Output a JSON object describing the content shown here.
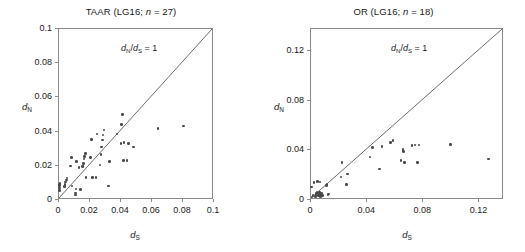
{
  "figure": {
    "background": "#ffffff",
    "point_color": "#4a4a4a",
    "axis_color": "#8a8a8a",
    "text_color": "#1a1a1a",
    "axis_label_x": "dS",
    "axis_label_y": "dN",
    "annotation": "dN/dS = 1"
  },
  "chart_data": [
    {
      "type": "scatter",
      "title": "TAAR (LG16; n = 27)",
      "title_prefix": "TAAR (LG16; ",
      "title_italic": "n",
      "title_suffix": " = 27)",
      "gene_family": "TAAR",
      "linkage_group": "LG16",
      "n": 27,
      "xlabel": "dS",
      "ylabel": "dN",
      "xlim": [
        0,
        0.1
      ],
      "ylim": [
        0,
        0.1
      ],
      "xticks": [
        0,
        0.02,
        0.04,
        0.06,
        0.08,
        0.1
      ],
      "xticklabels": [
        "0",
        "0.02",
        "0.04",
        "0.06",
        "0.08",
        "0.1"
      ],
      "yticks": [
        0,
        0.02,
        0.04,
        0.06,
        0.08,
        0.1
      ],
      "yticklabels": [
        "0",
        "0.02",
        "0.04",
        "0.06",
        "0.08",
        "0.1"
      ],
      "grid": false,
      "legend": "none",
      "annotations": [
        {
          "text": "dN/dS = 1",
          "x": 0.062,
          "y": 0.091
        }
      ],
      "reference_line": {
        "type": "diagonal",
        "slope": 1,
        "intercept": 0,
        "label": "dN/dS = 1"
      },
      "x": [
        0.0002,
        0.0003,
        0.0004,
        0.0005,
        0.0006,
        0.0035,
        0.004,
        0.0042,
        0.005,
        0.0052,
        0.0075,
        0.008,
        0.0085,
        0.0105,
        0.0108,
        0.011,
        0.0112,
        0.013,
        0.014,
        0.0152,
        0.0155,
        0.0158,
        0.016,
        0.0165,
        0.017,
        0.0175,
        0.0205,
        0.021,
        0.0215,
        0.024,
        0.0245,
        0.0265,
        0.027,
        0.0275,
        0.028,
        0.0285,
        0.029,
        0.032,
        0.0325,
        0.0375,
        0.04,
        0.0405,
        0.041,
        0.0415,
        0.042,
        0.044,
        0.045,
        0.048,
        0.064,
        0.0805
      ],
      "y": [
        0.0055,
        0.007,
        0.0085,
        0.0092,
        0.0098,
        0.0078,
        0.009,
        0.0105,
        0.0118,
        0.0128,
        0.02,
        0.0248,
        0.0082,
        0.003,
        0.004,
        0.0065,
        0.0225,
        0.019,
        0.0062,
        0.0195,
        0.02,
        0.0215,
        0.024,
        0.0255,
        0.0272,
        0.0132,
        0.025,
        0.0355,
        0.013,
        0.0132,
        0.0385,
        0.0205,
        0.0265,
        0.031,
        0.035,
        0.038,
        0.041,
        0.0082,
        0.0225,
        0.0385,
        0.033,
        0.044,
        0.05,
        0.0232,
        0.0335,
        0.0232,
        0.033,
        0.031,
        0.0418,
        0.0432
      ]
    },
    {
      "type": "scatter",
      "title": "OR (LG16; n = 18)",
      "title_prefix": "OR (LG16; ",
      "title_italic": "n",
      "title_suffix": " = 18)",
      "gene_family": "OR",
      "linkage_group": "LG16",
      "n": 18,
      "xlabel": "dS",
      "ylabel": "dN",
      "xlim": [
        0,
        0.1375
      ],
      "ylim": [
        0,
        0.1375
      ],
      "xticks": [
        0,
        0.04,
        0.08,
        0.12
      ],
      "xticklabels": [
        "0",
        "0.04",
        "0.08",
        "0.12"
      ],
      "yticks": [
        0,
        0.04,
        0.08,
        0.12
      ],
      "yticklabels": [
        "0",
        "0.04",
        "0.08",
        "0.12"
      ],
      "grid": false,
      "legend": "none",
      "annotations": [
        {
          "text": "dN/dS = 1",
          "x": 0.085,
          "y": 0.125
        }
      ],
      "reference_line": {
        "type": "diagonal",
        "slope": 1,
        "intercept": 0,
        "label": "dN/dS = 1"
      },
      "x": [
        0.0005,
        0.0008,
        0.0015,
        0.002,
        0.003,
        0.0035,
        0.0038,
        0.0042,
        0.0048,
        0.0055,
        0.006,
        0.0062,
        0.0065,
        0.0068,
        0.0075,
        0.008,
        0.011,
        0.0115,
        0.012,
        0.0125,
        0.0215,
        0.022,
        0.0255,
        0.0262,
        0.042,
        0.044,
        0.049,
        0.0505,
        0.0565,
        0.0585,
        0.064,
        0.0655,
        0.066,
        0.0665,
        0.072,
        0.074,
        0.076,
        0.077,
        0.0995,
        0.1265
      ],
      "y": [
        0.0105,
        0.0025,
        0.0038,
        0.014,
        0.003,
        0.0045,
        0.0052,
        0.0058,
        0.015,
        0.0038,
        0.0042,
        0.006,
        0.0145,
        0.003,
        0.0052,
        0.0035,
        0.0118,
        0.0125,
        0.004,
        0.0048,
        0.0185,
        0.03,
        0.0125,
        0.021,
        0.0345,
        0.042,
        0.025,
        0.0428,
        0.0462,
        0.048,
        0.0318,
        0.0408,
        0.0392,
        0.0302,
        0.0438,
        0.0442,
        0.03,
        0.0442,
        0.0448,
        0.033
      ]
    }
  ]
}
